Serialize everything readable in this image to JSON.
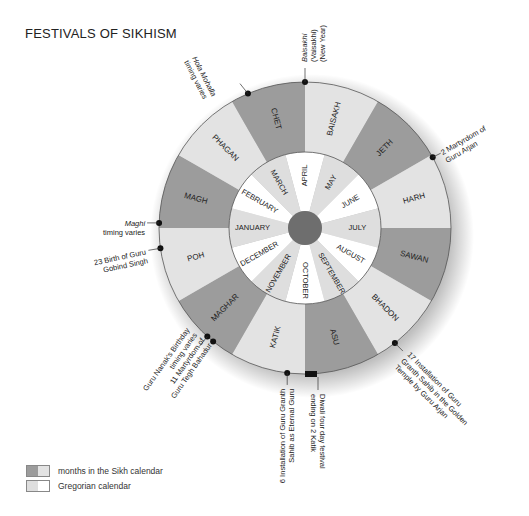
{
  "title": "FESTIVALS OF SIKHISM",
  "colors": {
    "sikh_dark": "#9c9c9c",
    "sikh_light": "#e3e3e3",
    "greg_light": "#dedede",
    "greg_white": "#ffffff",
    "center": "#6e6e6e",
    "stroke": "#555555",
    "text": "#222222"
  },
  "sikh_months": [
    "BAISAKH",
    "JETH",
    "HARH",
    "SAWAN",
    "BHADON",
    "ASU",
    "KATIK",
    "MAGHAR",
    "POH",
    "MAGH",
    "PHAGAN",
    "CHET"
  ],
  "gregorian_months": [
    "APRIL",
    "MAY",
    "JUNE",
    "JULY",
    "AUGUST",
    "SEPTEMBER",
    "OCTOBER",
    "NOVEMBER",
    "DECEMBER",
    "JANUARY",
    "FEBRUARY",
    "MARCH"
  ],
  "festivals": [
    {
      "id": "hola",
      "lines": [
        "Hola Mohalla",
        "timing varies"
      ],
      "italic_first": true
    },
    {
      "id": "baisakhi",
      "lines": [
        "Baisakhi",
        "(Vaisakhi)",
        "(New Year)"
      ],
      "italic_first": true
    },
    {
      "id": "arjan",
      "lines": [
        "2 Martyrdom of",
        "Guru Arjan"
      ]
    },
    {
      "id": "maghi",
      "lines": [
        "Maghi",
        "timing varies"
      ],
      "italic_first": true
    },
    {
      "id": "gobind",
      "lines": [
        "23 Birth of Guru",
        "Gobind Singh"
      ]
    },
    {
      "id": "nanak",
      "lines": [
        "Guru Nanak's Birthday",
        "timing varies",
        "11 Martyrdom of",
        "Guru Tegh Bahadur"
      ]
    },
    {
      "id": "granth",
      "lines": [
        "6 Installation of Guru Granth",
        "Sahib as Eternal Guru"
      ]
    },
    {
      "id": "diwali",
      "lines": [
        "Diwali four day festival",
        "ending on 2 Katik"
      ]
    },
    {
      "id": "golden",
      "lines": [
        "17 Installation of Guru",
        "Granth Sahib in the Golden",
        "Temple by Guru Arjan"
      ]
    }
  ],
  "legend": {
    "items": [
      {
        "label": "months in the Sikh calendar"
      },
      {
        "label": "Gregorian calendar"
      }
    ]
  }
}
